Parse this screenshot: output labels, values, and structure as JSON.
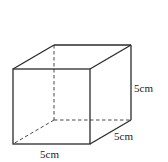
{
  "figure": {
    "type": "cube",
    "labels": {
      "height": "5cm",
      "depth": "5cm",
      "width": "5cm"
    },
    "colors": {
      "stroke": "#2b2b2b",
      "background": "#ffffff"
    }
  }
}
